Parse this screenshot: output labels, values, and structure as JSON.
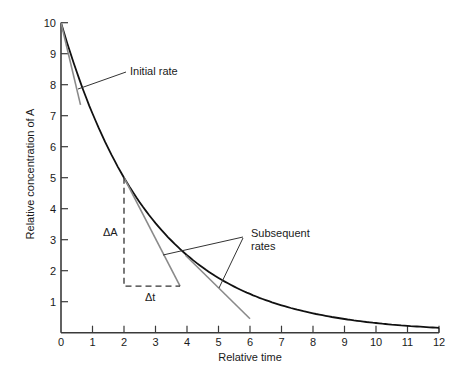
{
  "chart_data": {
    "type": "line",
    "title": "",
    "xlabel": "Relative time",
    "ylabel": "Relative concentration of A",
    "xlim": [
      0,
      12
    ],
    "ylim": [
      0,
      10
    ],
    "grid": false,
    "legend": "none",
    "x_ticks": [
      "0",
      "1",
      "2",
      "3",
      "4",
      "5",
      "6",
      "7",
      "8",
      "9",
      "10",
      "11",
      "12"
    ],
    "y_ticks": [
      "1",
      "2",
      "3",
      "4",
      "5",
      "6",
      "7",
      "8",
      "9",
      "10"
    ],
    "series": [
      {
        "name": "Concentration of A (exponential decay, half-life 2)",
        "x": [
          0,
          0.5,
          1,
          1.5,
          2,
          2.5,
          3,
          3.5,
          4,
          4.5,
          5,
          5.5,
          6,
          7,
          8,
          9,
          10,
          11,
          12
        ],
        "values": [
          10,
          8.41,
          7.07,
          5.95,
          5.0,
          4.2,
          3.54,
          2.97,
          2.5,
          2.1,
          1.77,
          1.49,
          1.25,
          0.88,
          0.63,
          0.44,
          0.31,
          0.22,
          0.16
        ]
      }
    ],
    "tangent_lines": [
      {
        "name": "initial-rate-tangent",
        "from": [
          0,
          10
        ],
        "to": [
          0.62,
          7.35
        ]
      },
      {
        "name": "subsequent-rate-tangent-1",
        "from": [
          2,
          5
        ],
        "to": [
          3.78,
          1.5
        ]
      },
      {
        "name": "subsequent-rate-tangent-2",
        "from": [
          3.95,
          2.5
        ],
        "to": [
          6.0,
          0.45
        ]
      }
    ],
    "rate_triangle": {
      "from": [
        2,
        5
      ],
      "corner": [
        2,
        1.5
      ],
      "to": [
        3.78,
        1.5
      ]
    },
    "annotations": [
      {
        "text": "Initial rate",
        "points_to": [
          0.6,
          7.8
        ]
      },
      {
        "text": "Subsequent",
        "line2": "rates",
        "points_to": [
          [
            3.3,
            2.5
          ],
          [
            5.0,
            1.5
          ]
        ]
      },
      {
        "text": "ΔA",
        "at": [
          1.6,
          3.25
        ]
      },
      {
        "text": "Δt",
        "at": [
          2.9,
          1.0
        ]
      }
    ]
  },
  "labels": {
    "xlabel": "Relative time",
    "ylabel": "Relative concentration of A",
    "initial_rate": "Initial rate",
    "subsequent_line1": "Subsequent",
    "subsequent_line2": "rates",
    "delta_a": "ΔA",
    "delta_t": "Δt"
  },
  "colors": {
    "curve": "#111111",
    "axis": "#3a3a3a",
    "tangent": "#8a8a8a",
    "leader": "#333333",
    "dashed": "#333333"
  }
}
